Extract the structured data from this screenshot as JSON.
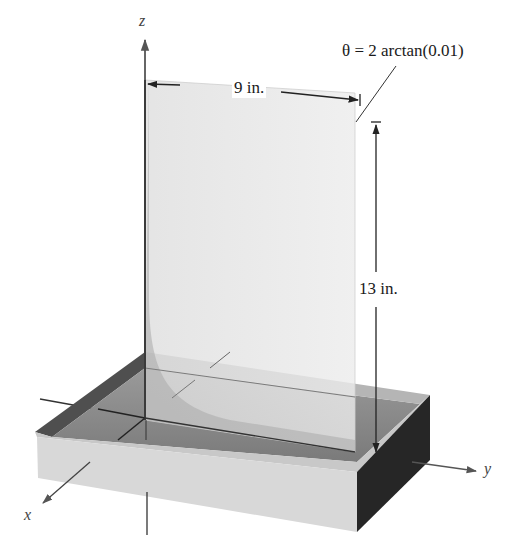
{
  "figure": {
    "type": "3d-diagram"
  },
  "labels": {
    "z_axis": "z",
    "x_axis": "x",
    "y_axis": "y",
    "width_dimension": "9 in.",
    "height_dimension": "13 in.",
    "angle_annotation": "θ = 2 arctan(0.01)"
  },
  "colors": {
    "background": "#ffffff",
    "plate": "#e6e6e6",
    "tray_front": "#d9d9d9",
    "tray_side": "#2b2b2b",
    "tray_inner_wall": "#5a5a5a",
    "liquid": "#8c8c8c",
    "axis": "#333333"
  }
}
